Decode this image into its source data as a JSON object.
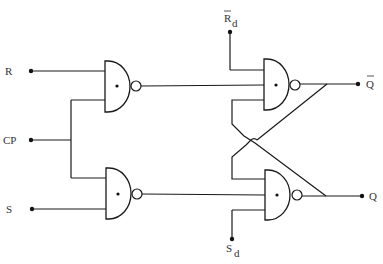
{
  "diagram": {
    "type": "clocked RS flip-flop logic circuit",
    "colors": {
      "line": "#1a1a1a",
      "text": "#333333",
      "background": "#ffffff"
    },
    "inputs": [
      {
        "id": "R",
        "label": "R"
      },
      {
        "id": "CP",
        "label": "CP"
      },
      {
        "id": "S",
        "label": "S"
      }
    ],
    "direct_inputs": {
      "reset": {
        "main": "R",
        "subscript": "d",
        "overbar": true
      },
      "set": {
        "main": "S",
        "subscript": "d",
        "overbar": false
      }
    },
    "outputs": {
      "q_bar": {
        "label": "Q",
        "overbar": true
      },
      "q": {
        "label": "Q",
        "overbar": false
      }
    },
    "gates": [
      {
        "id": "G1",
        "type": "NAND",
        "inputs": [
          "R",
          "CP"
        ]
      },
      {
        "id": "G2",
        "type": "NAND",
        "inputs": [
          "Rd",
          "G1",
          "Q"
        ]
      },
      {
        "id": "G3",
        "type": "NAND",
        "inputs": [
          "CP",
          "S"
        ]
      },
      {
        "id": "G4",
        "type": "NAND",
        "inputs": [
          "Q_bar",
          "G3",
          "Sd"
        ]
      }
    ]
  }
}
